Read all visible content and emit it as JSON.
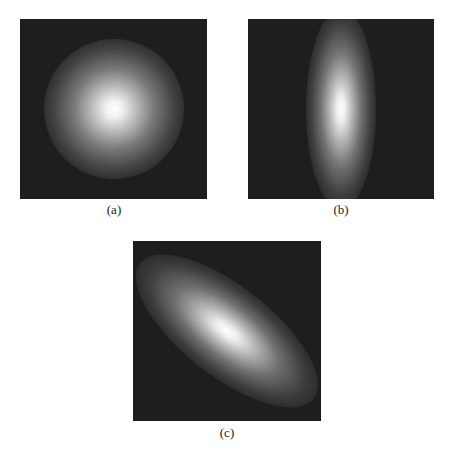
{
  "figure": {
    "panels": [
      {
        "id": "a",
        "caption": "(a)",
        "shape": "circular gaussian blob",
        "orientation": "isotropic"
      },
      {
        "id": "b",
        "caption": "(b)",
        "shape": "vertically elongated gaussian blob",
        "orientation": "vertical"
      },
      {
        "id": "c",
        "caption": "(c)",
        "shape": "diagonally elongated gaussian blob",
        "orientation": "diagonal top-left to bottom-right"
      }
    ],
    "colors": {
      "background": "#1e1e1e",
      "peak": "#ffffff"
    }
  }
}
